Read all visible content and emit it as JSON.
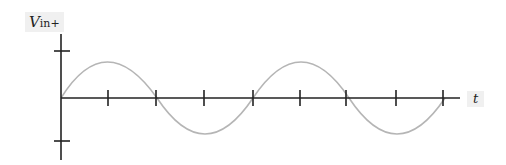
{
  "diagram": {
    "y_label": {
      "main": "V",
      "sub": "in+"
    },
    "x_label": "t",
    "axis_color": "#222222",
    "wave_color": "#b5b5b5",
    "wave": {
      "type": "sine",
      "periods": 2,
      "amplitude_ticks": [
        "+",
        "-"
      ]
    },
    "x_tick_count": 8
  }
}
